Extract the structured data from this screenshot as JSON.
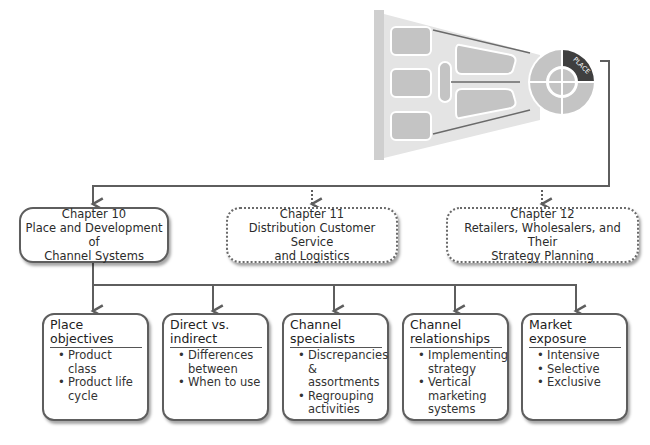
{
  "graphic": {
    "label": "PLACE",
    "colors": {
      "funnel_bg": "#e6e6e6",
      "shape_fill": "#c4c4c4",
      "highlight": "#3f3f3f",
      "line": "#5e5e5e"
    }
  },
  "chapters": [
    {
      "number": "Chapter 10",
      "title": "Place and Development of Channel Systems",
      "line1": "Place and Development of",
      "line2": "Channel Systems",
      "style": "solid"
    },
    {
      "number": "Chapter 11",
      "title": "Distribution Customer Service and Logistics",
      "line1": "Distribution Customer Service",
      "line2": "and Logistics",
      "style": "dotted"
    },
    {
      "number": "Chapter 12",
      "title": "Retailers, Wholesalers, and Their Strategy Planning",
      "line1": "Retailers, Wholesalers, and Their",
      "line2": "Strategy Planning",
      "style": "dotted"
    }
  ],
  "topics": [
    {
      "heading": "Place objectives",
      "items": [
        "Product class",
        "Product life cycle"
      ]
    },
    {
      "heading": "Direct vs. indirect",
      "items": [
        "Differences between",
        "When to use"
      ]
    },
    {
      "heading": "Channel specialists",
      "items": [
        "Discrepancies & assortments",
        "Regrouping activities"
      ]
    },
    {
      "heading": "Channel relationships",
      "items": [
        "Implementing strategy",
        "Vertical marketing systems"
      ]
    },
    {
      "heading": "Market exposure",
      "items": [
        "Intensive",
        "Selective",
        "Exclusive"
      ]
    }
  ]
}
